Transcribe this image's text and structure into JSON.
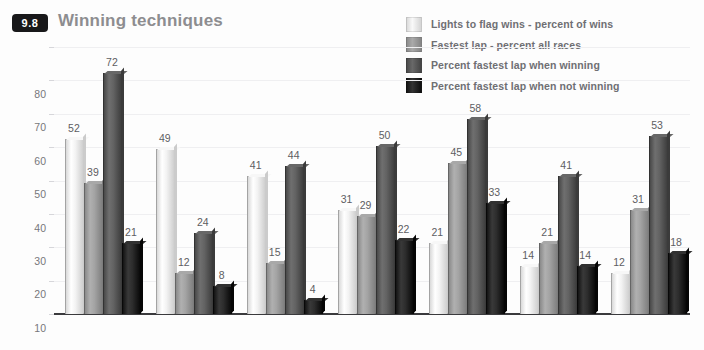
{
  "header": {
    "badge": "9.8",
    "title": "Winning techniques"
  },
  "chart_data": {
    "type": "bar",
    "title": "Winning techniques",
    "xlabel": "",
    "ylabel": "",
    "ylim": [
      0,
      80
    ],
    "yticks": [
      0,
      10,
      20,
      30,
      40,
      50,
      60,
      70,
      80
    ],
    "grid": true,
    "legend_position": "top-right",
    "categories": [
      "J Clark",
      "A Senna",
      "J Stewart",
      "S Moss",
      "JM Fangio",
      "A Prost",
      "M Schumacher"
    ],
    "series": [
      {
        "name": "Lights to flag wins - percent of wins",
        "color": "#e9e9e9",
        "values": [
          52,
          49,
          41,
          31,
          21,
          14,
          12
        ]
      },
      {
        "name": "Fastest lap - percent all races",
        "color": "#9a9a9a",
        "values": [
          39,
          12,
          15,
          29,
          45,
          21,
          31
        ]
      },
      {
        "name": "Percent fastest lap when winning",
        "color": "#595959",
        "values": [
          72,
          24,
          44,
          50,
          58,
          41,
          53
        ]
      },
      {
        "name": "Percent fastest lap when not winning",
        "color": "#232323",
        "values": [
          21,
          8,
          4,
          22,
          33,
          14,
          18
        ]
      }
    ]
  }
}
